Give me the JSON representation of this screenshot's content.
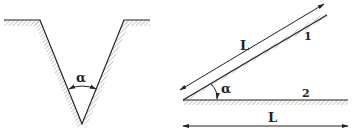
{
  "figure": {
    "left_diagram": {
      "description": "V-shaped groove with angle",
      "angle_label": "α"
    },
    "right_diagram": {
      "description": "Inclined plane 1 at angle to horizontal plane 2",
      "incline_length_label": "L",
      "incline_number_label": "1",
      "horizontal_number_label": "2",
      "angle_label": "α",
      "horizontal_length_label": "L"
    },
    "colors": {
      "line": "#222222",
      "hatch": "#9a9a9a",
      "background": "#ffffff"
    }
  }
}
